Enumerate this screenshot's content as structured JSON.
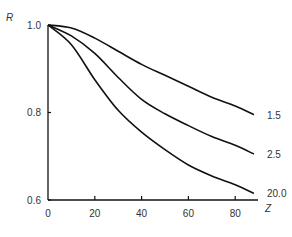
{
  "chart_data": {
    "type": "line",
    "title": "",
    "xlabel": "Z",
    "ylabel": "R",
    "xlim": [
      0,
      90
    ],
    "ylim": [
      0.6,
      1.0
    ],
    "xticks": [
      "0",
      "20",
      "40",
      "60",
      "80"
    ],
    "yticks": [
      "0.6",
      "0.8",
      "1.0"
    ],
    "grid": false,
    "legend": "inline labels at right end of curves",
    "x": [
      0,
      10,
      20,
      30,
      40,
      50,
      60,
      70,
      80,
      88
    ],
    "series": [
      {
        "name": "1.5",
        "values": [
          1.0,
          0.993,
          0.97,
          0.94,
          0.91,
          0.885,
          0.86,
          0.835,
          0.815,
          0.795
        ]
      },
      {
        "name": "2.5",
        "values": [
          1.0,
          0.975,
          0.935,
          0.88,
          0.83,
          0.797,
          0.77,
          0.745,
          0.725,
          0.705
        ]
      },
      {
        "name": "20.0",
        "values": [
          1.0,
          0.955,
          0.875,
          0.805,
          0.755,
          0.715,
          0.68,
          0.655,
          0.635,
          0.615
        ]
      }
    ]
  }
}
